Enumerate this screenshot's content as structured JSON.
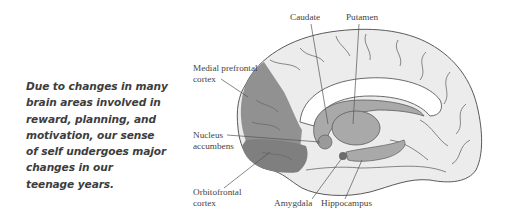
{
  "caption": {
    "lines": [
      "Due to changes in many",
      "brain areas involved in",
      "reward, planning, and",
      "motivation, our sense",
      "of self undergoes major",
      "changes in our",
      "teenage years."
    ]
  },
  "diagram": {
    "labels": {
      "caudate": "Caudate",
      "putamen": "Putamen",
      "medial_prefrontal_cortex": [
        "Medial prefrontal",
        "cortex"
      ],
      "nucleus_accumbens": [
        "Nucleus",
        "accumbens"
      ],
      "orbitofrontal_cortex": [
        "Orbitofrontal",
        "cortex"
      ],
      "amygdala": "Amygdala",
      "hippocampus": "Hippocampus"
    },
    "colors": {
      "cortex_fill": "#ececec",
      "highlight_dark": "#8c8c8c",
      "highlight_mid": "#a9a9a9",
      "outline": "#5a5a5a",
      "leader_line": "#555555"
    }
  }
}
